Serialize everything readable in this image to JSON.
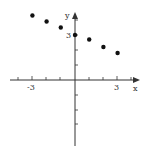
{
  "chart_data": {
    "type": "scatter",
    "title": "",
    "xlabel": "x",
    "ylabel": "y",
    "x": [
      -3,
      -2,
      -1,
      0,
      1,
      2,
      3
    ],
    "y": [
      4.3,
      3.9,
      3.5,
      3.0,
      2.7,
      2.2,
      1.8
    ],
    "x_tick_labels": [
      "-3",
      "3"
    ],
    "y_tick_labels": [
      "3"
    ],
    "xlim": [
      -5,
      7
    ],
    "ylim": [
      -5,
      5
    ],
    "grid": false,
    "legend": null
  },
  "axes": {
    "x_label": "x",
    "y_label": "y",
    "x_tick_neg": "-3",
    "x_tick_pos": "3",
    "y_tick": "3"
  },
  "colors": {
    "axis": "#333333",
    "points": "#111111"
  }
}
